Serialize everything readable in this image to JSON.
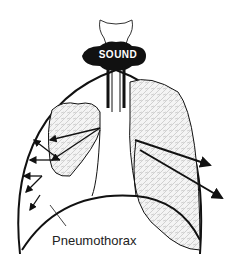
{
  "diagram": {
    "title_badge": "SOUND",
    "callout_label": "Pneumothorax",
    "colors": {
      "ink": "#111111",
      "background": "#ffffff",
      "lung_fill": "#e8e8e8"
    },
    "parts": [
      "larynx",
      "trachea",
      "bronchi",
      "left-lung",
      "collapsed-right-lung",
      "diaphragm",
      "chest-wall",
      "sound-arrows"
    ]
  }
}
